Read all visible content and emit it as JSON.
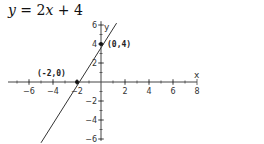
{
  "title": "y = 2x + 4",
  "chart_data": {
    "type": "line",
    "title": "y = 2x + 4",
    "equation": {
      "slope": 2,
      "intercept": 4
    },
    "xlabel": "x",
    "ylabel": "y",
    "xlim": [
      -8,
      8
    ],
    "ylim": [
      -6,
      6
    ],
    "x_ticks": [
      -6,
      -4,
      -2,
      2,
      4,
      6,
      8
    ],
    "y_ticks": [
      -6,
      -4,
      -2,
      2,
      4,
      6
    ],
    "grid": false,
    "series": [
      {
        "name": "y = 2x + 4",
        "x": [
          -5,
          1.3
        ],
        "y": [
          -6.4,
          6.2
        ]
      }
    ],
    "annotations": [
      {
        "label": "(-2,0)",
        "x": -2,
        "y": 0
      },
      {
        "label": "(0,4)",
        "x": 0,
        "y": 4
      }
    ]
  },
  "colors": {
    "axis": "#444444",
    "line": "#333333",
    "text": "#222222"
  }
}
